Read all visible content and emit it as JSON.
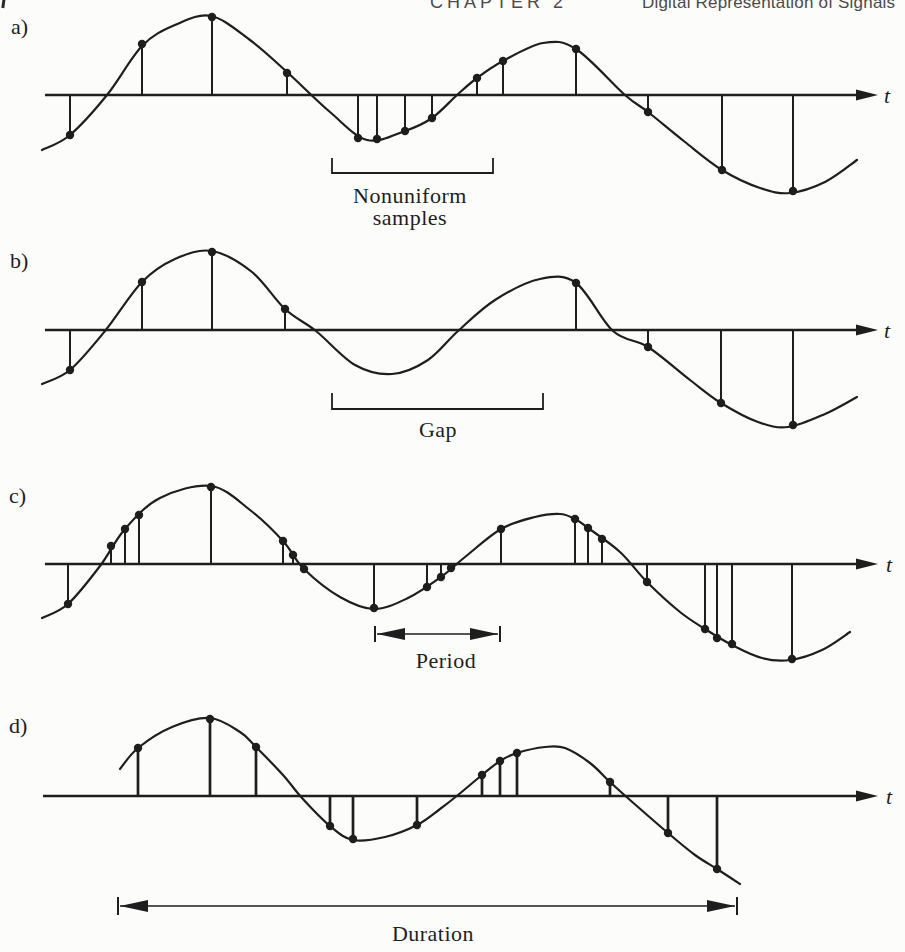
{
  "page": {
    "width": 905,
    "height": 952,
    "background": "#fcfcfb",
    "ink": "#1e1e1e",
    "header_ink": "#4b4b4b"
  },
  "header": {
    "chapter": "CHAPTER 2",
    "title": "Digital Representation of Signals"
  },
  "chart_data": [
    {
      "type": "line",
      "id": "a",
      "panel_label": "a)",
      "label_pos": [
        11,
        34
      ],
      "axis": {
        "y": 95,
        "x1": 45,
        "x2": 856,
        "tip": 878,
        "t_label": "t",
        "t_pos": [
          884,
          103
        ]
      },
      "curve_points_px": [
        [
          42,
          150
        ],
        [
          70,
          135
        ],
        [
          107,
          95
        ],
        [
          142,
          46
        ],
        [
          175,
          25
        ],
        [
          211,
          16
        ],
        [
          250,
          40
        ],
        [
          287,
          72
        ],
        [
          330,
          112
        ],
        [
          367,
          140
        ],
        [
          405,
          131
        ],
        [
          432,
          118
        ],
        [
          457,
          95
        ],
        [
          477,
          78
        ],
        [
          503,
          61
        ],
        [
          543,
          43
        ],
        [
          576,
          49
        ],
        [
          625,
          95
        ],
        [
          648,
          112
        ],
        [
          685,
          142
        ],
        [
          722,
          170
        ],
        [
          760,
          188
        ],
        [
          790,
          193
        ],
        [
          825,
          182
        ],
        [
          857,
          160
        ]
      ],
      "sample_points_px": [
        [
          70,
          135
        ],
        [
          142,
          44
        ],
        [
          212,
          17
        ],
        [
          287,
          73
        ],
        [
          358,
          138
        ],
        [
          377,
          139
        ],
        [
          405,
          131
        ],
        [
          432,
          118
        ],
        [
          477,
          78
        ],
        [
          503,
          61
        ],
        [
          576,
          49
        ],
        [
          648,
          112
        ],
        [
          722,
          170
        ],
        [
          793,
          191
        ]
      ],
      "annotation": {
        "kind": "bracket",
        "x1": 332,
        "x2": 493,
        "bar_y": 173,
        "tick_y": 158,
        "lines": [
          "Nonuniform",
          "samples"
        ],
        "text_x": 410,
        "text_y": 203,
        "line_height": 22
      }
    },
    {
      "type": "line",
      "id": "b",
      "panel_label": "b)",
      "label_pos": [
        10,
        268
      ],
      "axis": {
        "y": 330,
        "x1": 45,
        "x2": 856,
        "tip": 878,
        "t_label": "t",
        "t_pos": [
          884,
          338
        ]
      },
      "curve_points_px": [
        [
          42,
          384
        ],
        [
          70,
          370
        ],
        [
          105,
          331
        ],
        [
          142,
          282
        ],
        [
          175,
          259
        ],
        [
          212,
          251
        ],
        [
          252,
          272
        ],
        [
          285,
          309
        ],
        [
          316,
          331
        ],
        [
          355,
          365
        ],
        [
          392,
          374
        ],
        [
          428,
          360
        ],
        [
          458,
          331
        ],
        [
          495,
          300
        ],
        [
          540,
          279
        ],
        [
          576,
          283
        ],
        [
          613,
          331
        ],
        [
          648,
          347
        ],
        [
          690,
          380
        ],
        [
          721,
          403
        ],
        [
          758,
          422
        ],
        [
          788,
          427
        ],
        [
          825,
          414
        ],
        [
          857,
          397
        ]
      ],
      "sample_points_px": [
        [
          70,
          370
        ],
        [
          142,
          282
        ],
        [
          212,
          252
        ],
        [
          285,
          309
        ],
        [
          576,
          283
        ],
        [
          648,
          347
        ],
        [
          721,
          403
        ],
        [
          793,
          425
        ]
      ],
      "annotation": {
        "kind": "bracket",
        "x1": 332,
        "x2": 543,
        "bar_y": 409,
        "tick_y": 393,
        "lines": [
          "Gap"
        ],
        "text_x": 438,
        "text_y": 437,
        "line_height": 22
      }
    },
    {
      "type": "line",
      "id": "c",
      "panel_label": "c)",
      "label_pos": [
        9,
        503
      ],
      "axis": {
        "y": 564,
        "x1": 45,
        "x2": 856,
        "tip": 878,
        "t_label": "t",
        "t_pos": [
          886,
          572
        ]
      },
      "curve_points_px": [
        [
          42,
          618
        ],
        [
          68,
          604
        ],
        [
          100,
          566
        ],
        [
          125,
          529
        ],
        [
          160,
          498
        ],
        [
          211,
          486
        ],
        [
          250,
          510
        ],
        [
          283,
          541
        ],
        [
          304,
          569
        ],
        [
          340,
          597
        ],
        [
          374,
          609
        ],
        [
          408,
          598
        ],
        [
          441,
          577
        ],
        [
          465,
          557
        ],
        [
          501,
          529
        ],
        [
          535,
          517
        ],
        [
          560,
          514
        ],
        [
          575,
          519
        ],
        [
          588,
          528
        ],
        [
          620,
          552
        ],
        [
          647,
          582
        ],
        [
          680,
          612
        ],
        [
          705,
          629
        ],
        [
          732,
          645
        ],
        [
          762,
          658
        ],
        [
          790,
          660
        ],
        [
          822,
          650
        ],
        [
          850,
          632
        ]
      ],
      "sample_points_px": [
        [
          68,
          604
        ],
        [
          111,
          546
        ],
        [
          125,
          529
        ],
        [
          139,
          515
        ],
        [
          211,
          487
        ],
        [
          283,
          541
        ],
        [
          293,
          555
        ],
        [
          304,
          569
        ],
        [
          374,
          608
        ],
        [
          427,
          587
        ],
        [
          441,
          577
        ],
        [
          451,
          568
        ],
        [
          501,
          529
        ],
        [
          575,
          519
        ],
        [
          588,
          528
        ],
        [
          602,
          539
        ],
        [
          647,
          582
        ],
        [
          705,
          629
        ],
        [
          717,
          638
        ],
        [
          732,
          644
        ],
        [
          792,
          659
        ]
      ],
      "annotation": {
        "kind": "darrow",
        "x1": 375,
        "x2": 500,
        "bar_y": 634,
        "tick_half": 8,
        "lines": [
          "Period"
        ],
        "text_x": 446,
        "text_y": 668,
        "line_height": 22
      }
    },
    {
      "type": "line",
      "id": "d",
      "panel_label": "d)",
      "label_pos": [
        9,
        733
      ],
      "axis": {
        "y": 796,
        "x1": 43,
        "x2": 856,
        "tip": 878,
        "t_label": "t",
        "t_pos": [
          886,
          804
        ]
      },
      "curve_points_px": [
        [
          120,
          769
        ],
        [
          138,
          748
        ],
        [
          172,
          727
        ],
        [
          210,
          718
        ],
        [
          240,
          732
        ],
        [
          256,
          747
        ],
        [
          283,
          775
        ],
        [
          302,
          798
        ],
        [
          330,
          826
        ],
        [
          353,
          840
        ],
        [
          385,
          837
        ],
        [
          417,
          825
        ],
        [
          440,
          809
        ],
        [
          458,
          795
        ],
        [
          482,
          775
        ],
        [
          500,
          761
        ],
        [
          517,
          753
        ],
        [
          545,
          747
        ],
        [
          565,
          748
        ],
        [
          590,
          763
        ],
        [
          610,
          782
        ],
        [
          630,
          800
        ],
        [
          668,
          833
        ],
        [
          695,
          855
        ],
        [
          717,
          869
        ],
        [
          740,
          884
        ]
      ],
      "sample_points_px": [
        [
          138,
          748
        ],
        [
          210,
          719
        ],
        [
          256,
          747
        ],
        [
          330,
          826
        ],
        [
          353,
          839
        ],
        [
          417,
          825
        ],
        [
          482,
          775
        ],
        [
          500,
          761
        ],
        [
          517,
          753
        ],
        [
          610,
          782
        ],
        [
          668,
          833
        ],
        [
          717,
          869
        ]
      ],
      "stem_width": 2.7,
      "annotation": {
        "kind": "darrow",
        "x1": 118,
        "x2": 737,
        "bar_y": 906,
        "tick_half": 9,
        "lines": [
          "Duration"
        ],
        "text_x": 433,
        "text_y": 941,
        "line_height": 22
      }
    }
  ]
}
